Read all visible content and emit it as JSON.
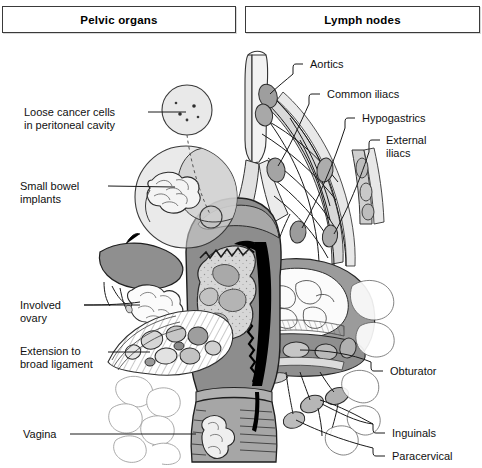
{
  "figure": {
    "title_boxes": [
      {
        "id": "pelvic",
        "label": "Pelvic organs"
      },
      {
        "id": "lymph",
        "label": "Lymph nodes"
      }
    ],
    "labels_left": [
      {
        "id": "loose-cancer-cells",
        "text": "Loose cancer cells\nin peritoneal cavity",
        "x": 24,
        "y": 106
      },
      {
        "id": "small-bowel-implants",
        "text": "Small bowel\nimplants",
        "x": 20,
        "y": 180
      },
      {
        "id": "involved-ovary",
        "text": "Involved\novary",
        "x": 20,
        "y": 301
      },
      {
        "id": "extension-broad-ligament",
        "text": "Extension to\nbroad ligament",
        "x": 20,
        "y": 344
      },
      {
        "id": "vagina",
        "text": "Vagina",
        "x": 23,
        "y": 428
      }
    ],
    "labels_right": [
      {
        "id": "aortics",
        "text": "Aortics",
        "x": 310,
        "y": 61
      },
      {
        "id": "common-iliacs",
        "text": "Common iliacs",
        "x": 327,
        "y": 91
      },
      {
        "id": "hypogastrics",
        "text": "Hypogastrics",
        "x": 362,
        "y": 115
      },
      {
        "id": "external-iliacs",
        "text": "External\niliacs",
        "x": 386,
        "y": 137
      },
      {
        "id": "obturator",
        "text": "Obturator",
        "x": 390,
        "y": 368
      },
      {
        "id": "inguinals",
        "text": "Inguinals",
        "x": 392,
        "y": 430
      },
      {
        "id": "paracervical",
        "text": "Paracervical",
        "x": 392,
        "y": 453
      }
    ],
    "colors": {
      "background": "#ffffff",
      "outline": "#1a1a1a",
      "tissue_light": "#efefef",
      "tissue_mid": "#cfcfcf",
      "tissue_dark": "#9a9a9a",
      "tissue_darker": "#7e7e7e",
      "cavity_black": "#000000",
      "leader_line": "#1a1a1a",
      "box_border": "#3a3a3a",
      "text": "#111111"
    },
    "anatomy_parts": [
      "aorta",
      "common-iliac-vessels",
      "hypogastric-vessels",
      "external-iliac-vessels",
      "lymph-node-chain",
      "uterus",
      "endometrial-cavity",
      "tumor-mass",
      "cervix",
      "vagina",
      "ovary",
      "broad-ligament",
      "small-bowel-loops",
      "peritoneal-cavity-inset",
      "obturator-node",
      "inguinal-nodes",
      "paracervical-node"
    ]
  }
}
